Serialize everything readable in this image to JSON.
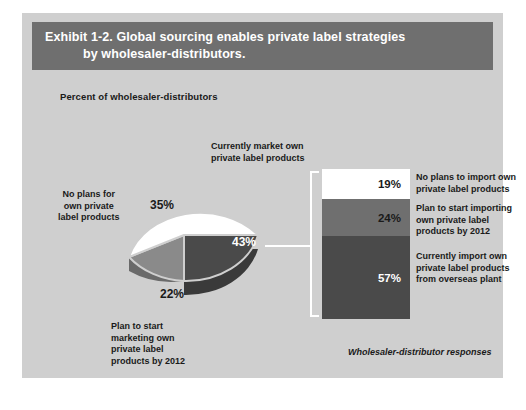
{
  "exhibit": {
    "title_line1": "Exhibit 1-2. Global sourcing enables private label strategies",
    "title_line2": "by wholesaler-distributors.",
    "subtitle": "Percent of wholesaler-distributors",
    "footnote": "Wholesaler-distributor responses",
    "banner_color": "#6f6f6f",
    "canvas_color": "#cfcfcf"
  },
  "pie": {
    "labels": {
      "no_plans": "No plans for\nown private\nlabel products",
      "currently_market": "Currently market own\nprivate label products",
      "plan_to_start": "Plan to start\nmarketing own\nprivate label\nproducts by 2012"
    },
    "values": {
      "no_plans": "35%",
      "plan_to_start": "22%",
      "currently_market": "43%"
    }
  },
  "stacked_bar": {
    "segments": [
      {
        "value": "19%",
        "label": "No plans to import own\nprivate label products",
        "color": "#ffffff"
      },
      {
        "value": "24%",
        "label": "Plan to start importing\nown private label\nproducts by 2012",
        "color": "#6f6f6f"
      },
      {
        "value": "57%",
        "label": "Currently import own\nprivate label products\nfrom overseas plant",
        "color": "#4a4a4a"
      }
    ]
  },
  "chart_data": [
    {
      "type": "pie",
      "title": "Exhibit 1-2. Global sourcing enables private label strategies by wholesaler-distributors.",
      "subtitle": "Percent of wholesaler-distributors",
      "categories": [
        "Currently market own private label products",
        "Plan to start marketing own private label products by 2012",
        "No plans for own private label products"
      ],
      "values": [
        43,
        22,
        35
      ],
      "unit": "percent",
      "colors": [
        "#4a4a4a",
        "#8a8a8a",
        "#ffffff"
      ],
      "legend": "none",
      "annotations": [
        "Wholesaler-distributor responses"
      ]
    },
    {
      "type": "bar",
      "orientation": "stacked-vertical",
      "title": "Breakdown of the 43% that currently market own private label products",
      "categories": [
        "No plans to import own private label products",
        "Plan to start importing own private label products by 2012",
        "Currently import own private label products from overseas plant"
      ],
      "values": [
        19,
        24,
        57
      ],
      "unit": "percent",
      "colors": [
        "#ffffff",
        "#6f6f6f",
        "#4a4a4a"
      ],
      "ylim": [
        0,
        100
      ],
      "grid": false,
      "legend": "right"
    }
  ]
}
